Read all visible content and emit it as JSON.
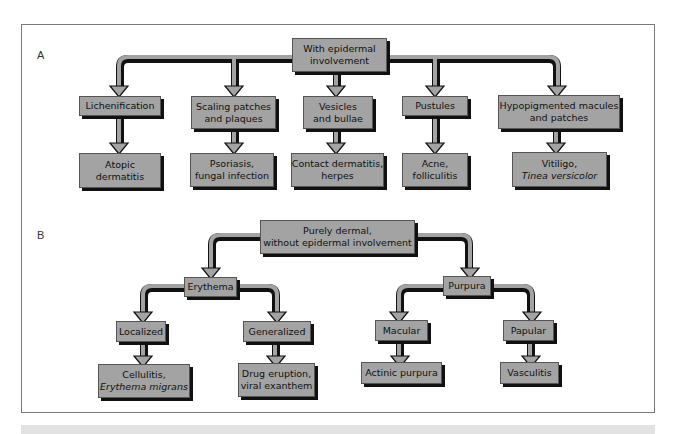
{
  "panels": {
    "A": {
      "label": "A",
      "root": {
        "line1": "With epidermal",
        "line2": "involvement"
      },
      "categories": [
        {
          "label1": "Lichenification",
          "label2": "",
          "result1": "Atopic",
          "result2": "dermatitis"
        },
        {
          "label1": "Scaling patches",
          "label2": "and plaques",
          "result1": "Psoriasis,",
          "result2": "fungal infection"
        },
        {
          "label1": "Vesicles",
          "label2": "and bullae",
          "result1": "Contact dermatitis,",
          "result2": "herpes"
        },
        {
          "label1": "Pustules",
          "label2": "",
          "result1": "Acne,",
          "result2": "folliculitis"
        },
        {
          "label1": "Hypopigmented macules",
          "label2": "and patches",
          "result1": "Vitiligo,",
          "result2": "Tinea versicolor"
        }
      ]
    },
    "B": {
      "label": "B",
      "root": {
        "line1": "Purely dermal,",
        "line2": "without epidermal involvement"
      },
      "branches": [
        {
          "label": "Erythema",
          "children": [
            {
              "label": "Localized",
              "result1": "Cellulitis,",
              "result2": "Erythema migrans"
            },
            {
              "label": "Generalized",
              "result1": "Drug eruption,",
              "result2": "viral exanthem"
            }
          ]
        },
        {
          "label": "Purpura",
          "children": [
            {
              "label": "Macular",
              "result1": "Actinic purpura",
              "result2": ""
            },
            {
              "label": "Papular",
              "result1": "Vasculitis",
              "result2": ""
            }
          ]
        }
      ]
    }
  },
  "colors": {
    "box_fill": "#a3a3a3",
    "box_shadow": "#111111",
    "arrow_fill": "#a3a3a3",
    "frame": "#7a7a7a",
    "bottom_bar": "#e2e2e2"
  }
}
